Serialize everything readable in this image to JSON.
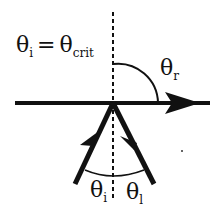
{
  "diagram": {
    "title_label": {
      "theta": "θ",
      "sub_i": "i",
      "equals": "=",
      "sub_crit": "crit"
    },
    "reflected_label": {
      "theta": "θ",
      "sub": "r"
    },
    "incident_label": {
      "theta": "θ",
      "sub": "i"
    },
    "internal_label": {
      "theta": "θ",
      "sub": "l"
    },
    "colors": {
      "ink": "#111111",
      "background": "#ffffff"
    }
  }
}
